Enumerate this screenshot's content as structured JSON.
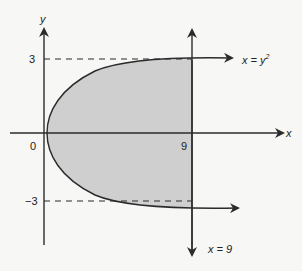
{
  "diagram": {
    "type": "region-between-curves",
    "axes": {
      "x_label": "x",
      "y_label": "y"
    },
    "tick_labels": {
      "origin": "0",
      "x_nine": "9",
      "y_pos": "3",
      "y_neg": "−3"
    },
    "curves": [
      {
        "name": "parabola",
        "equation_lhs": "x = y",
        "equation_exp": "2"
      },
      {
        "name": "vertical-line",
        "equation": "x = 9"
      }
    ],
    "shaded_region": {
      "description": "region between x = y^2 and x = 9",
      "fill": "#cfcfcf"
    },
    "colors": {
      "stroke": "#2b2b2b",
      "fill": "#cfcfcf",
      "background": "#f7f7f5"
    }
  }
}
